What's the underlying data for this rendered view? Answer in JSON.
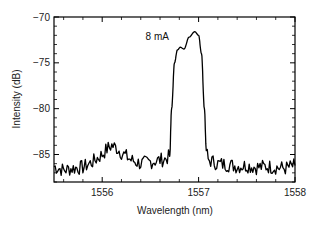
{
  "chart_data": {
    "type": "line",
    "title": "",
    "xlabel": "Wavelength (nm)",
    "ylabel": "Intensity (dB)",
    "xlim": [
      1555.5,
      1558
    ],
    "ylim": [
      -88,
      -70
    ],
    "xticks": [
      1556,
      1557,
      1558
    ],
    "xtick_labels": [
      "1556",
      "1557",
      "1558"
    ],
    "yticks": [
      -70,
      -75,
      -80,
      -85
    ],
    "ytick_labels": [
      "−70",
      "−75",
      "−80",
      "−85"
    ],
    "grid": false,
    "legend": null,
    "annotations": [
      {
        "text": "8 mA",
        "x": 1556.45,
        "y": -72.5
      }
    ],
    "series": [
      {
        "name": "8 mA spectrum",
        "color": "#000000",
        "x": [
          1555.5,
          1555.6,
          1555.7,
          1555.8,
          1555.9,
          1556.0,
          1556.05,
          1556.1,
          1556.15,
          1556.2,
          1556.3,
          1556.4,
          1556.5,
          1556.6,
          1556.65,
          1556.7,
          1556.72,
          1556.75,
          1556.78,
          1556.81,
          1556.85,
          1556.9,
          1556.96,
          1557.0,
          1557.03,
          1557.06,
          1557.08,
          1557.1,
          1557.2,
          1557.3,
          1557.4,
          1557.5,
          1557.6,
          1557.7,
          1557.8,
          1557.9,
          1558.0
        ],
        "y": [
          -86.3,
          -86.7,
          -86.5,
          -86.4,
          -85.8,
          -85.0,
          -84.4,
          -84.0,
          -84.3,
          -84.8,
          -85.6,
          -86.0,
          -85.8,
          -85.6,
          -85.5,
          -85.2,
          -80.0,
          -75.0,
          -73.6,
          -73.3,
          -73.5,
          -72.2,
          -71.6,
          -72.0,
          -74.0,
          -80.0,
          -84.5,
          -85.6,
          -86.0,
          -86.1,
          -86.3,
          -86.2,
          -86.4,
          -86.3,
          -86.4,
          -86.5,
          -86.2
        ]
      }
    ]
  }
}
